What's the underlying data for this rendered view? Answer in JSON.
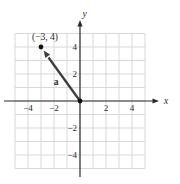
{
  "figure": {
    "point_label": "(−3, 4)",
    "vector_label": "a",
    "x_axis_label": "x",
    "y_axis_label": "y",
    "x_tick_labels": [
      "−4",
      "−2",
      "2",
      "4"
    ],
    "y_tick_labels": [
      "4",
      "2",
      "−2",
      "−4"
    ],
    "colors": {
      "background": "#ffffff",
      "grid": "#d8d8d8",
      "axis": "#2a2a2a",
      "vector": "#3d3d3d",
      "text": "#2a2a2a"
    }
  },
  "chart_data": {
    "type": "scatter",
    "title": "",
    "xlabel": "x",
    "ylabel": "y",
    "xlim": [
      -5,
      5
    ],
    "ylim": [
      -5,
      5
    ],
    "x_ticks": [
      -4,
      -2,
      2,
      4
    ],
    "y_ticks": [
      -4,
      -2,
      2,
      4
    ],
    "grid": true,
    "points": [
      {
        "x": -3,
        "y": 4,
        "label": "(−3, 4)"
      }
    ],
    "vectors": [
      {
        "name": "a",
        "tail": [
          0,
          0
        ],
        "tip": [
          -3,
          4
        ]
      }
    ]
  }
}
